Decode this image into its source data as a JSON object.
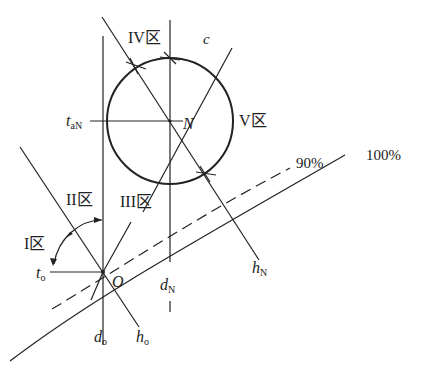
{
  "diagram": {
    "colors": {
      "stroke": "#222222",
      "background": "#ffffff"
    },
    "zones": {
      "zone1": "I区",
      "zone2": "II区",
      "zone3": "III区",
      "zone4": "IV区",
      "zone5": "V区"
    },
    "points": {
      "O": "O",
      "N": "N",
      "c": "c"
    },
    "labels": {
      "t_o": {
        "main": "t",
        "sub": "o"
      },
      "t_aN": {
        "main": "t",
        "sub": "aN"
      },
      "d_o": {
        "main": "d",
        "sub": "o"
      },
      "d_N": {
        "main": "d",
        "sub": "N"
      },
      "h_o": {
        "main": "h",
        "sub": "o"
      },
      "h_N": {
        "main": "h",
        "sub": "N"
      }
    },
    "curves": {
      "curve_90": "90%",
      "curve_100": "100%"
    }
  }
}
